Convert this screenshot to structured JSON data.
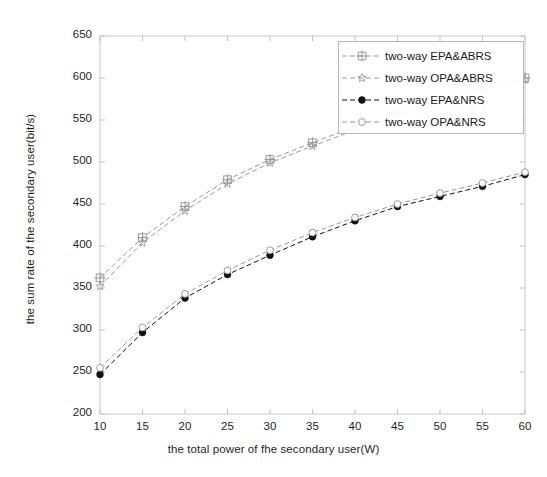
{
  "chart_data": {
    "type": "line",
    "title": "",
    "xlabel": "the total power of fhe secondary user(W)",
    "ylabel": "the sum rate of the secondary user(bit/s)",
    "xlim": [
      10,
      60
    ],
    "ylim": [
      200,
      650
    ],
    "xticks": [
      10,
      15,
      20,
      25,
      30,
      35,
      40,
      45,
      50,
      55,
      60
    ],
    "yticks": [
      200,
      250,
      300,
      350,
      400,
      450,
      500,
      550,
      600,
      650
    ],
    "grid": false,
    "legend_position": "upper right",
    "x": [
      10,
      15,
      20,
      25,
      30,
      35,
      40,
      45,
      50,
      55,
      60
    ],
    "series": [
      {
        "name": "two-way EPA&ABRS",
        "marker": "plus-in-square",
        "linestyle": "dashed",
        "color": "#9a9a9a",
        "values": [
          362,
          410,
          447,
          479,
          503,
          523,
          542,
          559,
          574,
          588,
          600
        ]
      },
      {
        "name": "two-way OPA&ABRS",
        "marker": "star",
        "linestyle": "dashed",
        "color": "#9a9a9a",
        "values": [
          352,
          404,
          442,
          474,
          499,
          519,
          538,
          556,
          571,
          585,
          598
        ]
      },
      {
        "name": "two-way EPA&NRS",
        "marker": "filled-circle",
        "linestyle": "dashed",
        "color": "#111111",
        "values": [
          247,
          297,
          338,
          366,
          389,
          411,
          430,
          447,
          459,
          471,
          485
        ]
      },
      {
        "name": "two-way OPA&NRS",
        "marker": "open-circle",
        "linestyle": "dashed",
        "color": "#9a9a9a",
        "values": [
          255,
          303,
          343,
          371,
          395,
          416,
          434,
          450,
          463,
          475,
          488
        ]
      }
    ]
  },
  "legend": {
    "entries": [
      {
        "label": "two-way EPA&ABRS",
        "marker": "plus-in-square-icon"
      },
      {
        "label": "two-way OPA&ABRS",
        "marker": "star-icon"
      },
      {
        "label": "two-way EPA&NRS",
        "marker": "filled-circle-icon"
      },
      {
        "label": "two-way OPA&NRS",
        "marker": "open-circle-icon"
      }
    ]
  },
  "axes": {
    "x_tick_labels": [
      "10",
      "15",
      "20",
      "25",
      "30",
      "35",
      "40",
      "45",
      "50",
      "55",
      "60"
    ],
    "y_tick_labels": [
      "200",
      "250",
      "300",
      "350",
      "400",
      "450",
      "500",
      "550",
      "600",
      "650"
    ],
    "xlabel": "the total power of fhe secondary user(W)",
    "ylabel": "the sum rate of the secondary user(bit/s)"
  }
}
